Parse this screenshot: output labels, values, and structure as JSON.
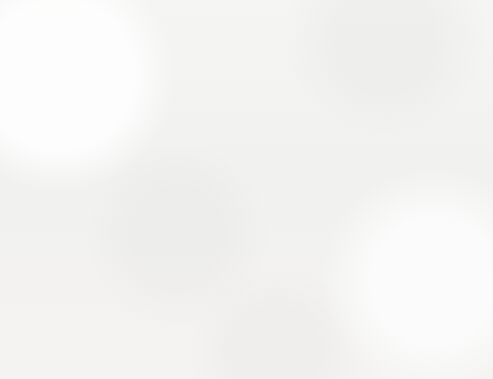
{
  "question_number": "48.",
  "y_axis_title_letters": [
    "F",
    "e",
    "e",
    "t"
  ],
  "colors": {
    "bar_fill": "#acacac",
    "frame": "#9a9a9a",
    "gridline": "#a8a8a8",
    "text": "#5d5d5d",
    "paper": "#f3f3f2"
  },
  "chart_data": {
    "type": "bar",
    "title": "Longest Underwater Automobile Tunnels in New York",
    "xlabel": "",
    "ylabel": "Feet",
    "categories": [
      "Brooklyn-Battery",
      "Holland",
      "Lincoln",
      "Queens Midtown"
    ],
    "values": [
      9000,
      8500,
      8000,
      6500
    ],
    "ylim": [
      0,
      10000
    ],
    "ytick_step": 1000,
    "ytick_labels": [
      "10,000",
      "9,000",
      "8,000",
      "7,000",
      "6,000",
      "5,000",
      "4,000",
      "3,000",
      "2,000",
      "1,000",
      "0"
    ],
    "ytick_values": [
      10000,
      9000,
      8000,
      7000,
      6000,
      5000,
      4000,
      3000,
      2000,
      1000,
      0
    ],
    "grid": true,
    "legend": false
  }
}
